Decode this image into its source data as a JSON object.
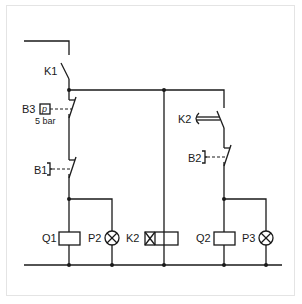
{
  "diagram": {
    "type": "electrical-circuit-schematic",
    "labels": {
      "k1": "K1",
      "b3": "B3",
      "b3_symbol": "p",
      "b3_setting": "5 bar",
      "b1": "B1",
      "k2_contact": "K2",
      "b2": "B2",
      "q1": "Q1",
      "p2": "P2",
      "k2_coil": "K2",
      "q2": "Q2",
      "p3": "P3"
    },
    "components": [
      {
        "id": "K1",
        "kind": "normally-open contact"
      },
      {
        "id": "B3",
        "kind": "pressure switch, normally-closed",
        "setting": "5 bar"
      },
      {
        "id": "B1",
        "kind": "pushbutton, normally-closed"
      },
      {
        "id": "K2",
        "kind": "delayed normally-open contact"
      },
      {
        "id": "B2",
        "kind": "pushbutton, normally-closed"
      },
      {
        "id": "Q1",
        "kind": "coil"
      },
      {
        "id": "P2",
        "kind": "indicator lamp"
      },
      {
        "id": "K2",
        "kind": "time-delay relay coil"
      },
      {
        "id": "Q2",
        "kind": "coil"
      },
      {
        "id": "P3",
        "kind": "indicator lamp"
      }
    ],
    "colors": {
      "line": "#1a1a1a",
      "frame": "#e4e4e4",
      "background": "#ffffff"
    }
  }
}
